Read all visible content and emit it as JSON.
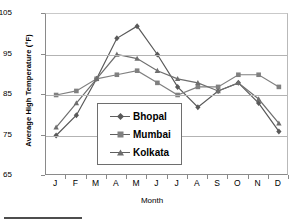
{
  "chart_data": {
    "type": "line",
    "title": "",
    "xlabel": "Month",
    "ylabel": "Average High Temperature (°F)",
    "categories": [
      "J",
      "F",
      "M",
      "A",
      "M",
      "J",
      "J",
      "A",
      "S",
      "O",
      "N",
      "D"
    ],
    "ylim": [
      65,
      105
    ],
    "yticks": [
      65,
      75,
      85,
      95,
      105
    ],
    "grid": true,
    "legend_position": "center",
    "series": [
      {
        "name": "Bhopal",
        "marker": "diamond",
        "color": "#595959",
        "values": [
          75,
          80,
          89,
          99,
          102,
          95,
          87,
          82,
          86,
          88,
          83,
          76
        ]
      },
      {
        "name": "Mumbai",
        "marker": "square",
        "color": "#808080",
        "values": [
          85,
          86,
          89,
          90,
          91,
          88,
          85,
          87,
          87,
          90,
          90,
          87
        ]
      },
      {
        "name": "Kolkata",
        "marker": "triangle",
        "color": "#6e6e6e",
        "values": [
          77,
          83,
          89,
          95,
          94,
          91,
          89,
          88,
          86,
          88,
          84,
          78
        ]
      }
    ]
  },
  "axes": {
    "y_tick_labels": [
      "105",
      "95",
      "85",
      "75",
      "65"
    ],
    "x_tick_labels": [
      "J",
      "F",
      "M",
      "A",
      "M",
      "J",
      "J",
      "A",
      "S",
      "O",
      "N",
      "D"
    ],
    "y_title": "Average High Temperature (°F)",
    "x_title": "Month"
  },
  "legend": {
    "items": [
      {
        "label": "Bhopal",
        "marker": "diamond-marker-icon"
      },
      {
        "label": "Mumbai",
        "marker": "square-marker-icon"
      },
      {
        "label": "Kolkata",
        "marker": "triangle-marker-icon"
      }
    ]
  }
}
